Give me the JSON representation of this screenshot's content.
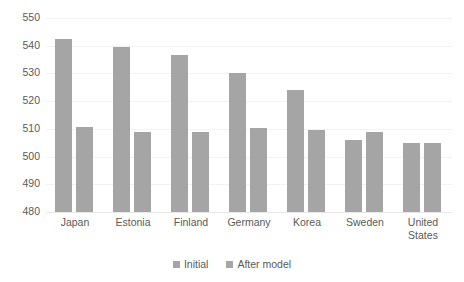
{
  "chart_data": {
    "type": "bar",
    "title": "",
    "subtitle": "",
    "xlabel": "",
    "ylabel": "",
    "ylim": [
      480,
      550
    ],
    "ytick_step": 10,
    "yticks": [
      550,
      540,
      530,
      520,
      510,
      500,
      490,
      480
    ],
    "grid": true,
    "legend_position": "bottom",
    "categories": [
      "Japan",
      "Estonia",
      "Finland",
      "Germany",
      "Korea",
      "Sweden",
      "United\nStates"
    ],
    "series": [
      {
        "name": "Initial",
        "color": "#a5a5a5",
        "values": [
          542.5,
          539.5,
          536.5,
          530.0,
          524.0,
          506.0,
          505.0
        ]
      },
      {
        "name": "After model",
        "color": "#a5a5a5",
        "values": [
          510.5,
          509.0,
          508.8,
          510.3,
          509.5,
          509.0,
          505.0
        ]
      }
    ]
  },
  "legend": {
    "items": [
      {
        "label": "Initial"
      },
      {
        "label": "After model"
      }
    ]
  },
  "colors": {
    "bar": "#a5a5a5",
    "gridline": "#f2f2f2",
    "text": "#5a5a5a",
    "background": "#ffffff"
  }
}
